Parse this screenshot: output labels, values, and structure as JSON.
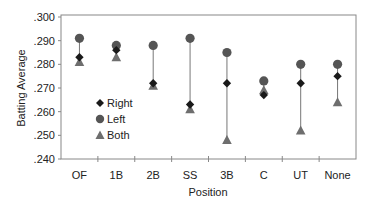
{
  "chart_data": {
    "type": "scatter",
    "subtype": "dot-range",
    "title": "",
    "xlabel": "Position",
    "ylabel": "Batting Average",
    "categories": [
      "OF",
      "1B",
      "2B",
      "SS",
      "3B",
      "C",
      "UT",
      "None"
    ],
    "ylim": [
      0.24,
      0.3
    ],
    "yticks": [
      ".300",
      ".290",
      ".280",
      ".270",
      ".260",
      ".250",
      ".240"
    ],
    "ytick_values": [
      0.3,
      0.29,
      0.28,
      0.27,
      0.26,
      0.25,
      0.24
    ],
    "grid": false,
    "legend_position": "inside-lower-left",
    "series": [
      {
        "name": "Right",
        "marker": "diamond",
        "color": "#1a1a1a",
        "values": [
          0.283,
          0.286,
          0.272,
          0.263,
          0.272,
          0.267,
          0.272,
          0.275
        ]
      },
      {
        "name": "Left",
        "marker": "circle",
        "color": "#555555",
        "values": [
          0.291,
          0.288,
          0.288,
          0.291,
          0.285,
          0.273,
          0.28,
          0.28
        ]
      },
      {
        "name": "Both",
        "marker": "triangle",
        "color": "#6e6e6e",
        "values": [
          0.281,
          0.283,
          0.271,
          0.261,
          0.248,
          0.269,
          0.252,
          0.264
        ]
      }
    ]
  },
  "legend": {
    "items": [
      {
        "label": "Right",
        "icon": "diamond-icon"
      },
      {
        "label": "Left",
        "icon": "circle-icon"
      },
      {
        "label": "Both",
        "icon": "triangle-icon"
      }
    ]
  },
  "axes": {
    "xlabel": "Position",
    "ylabel": "Batting Average"
  }
}
